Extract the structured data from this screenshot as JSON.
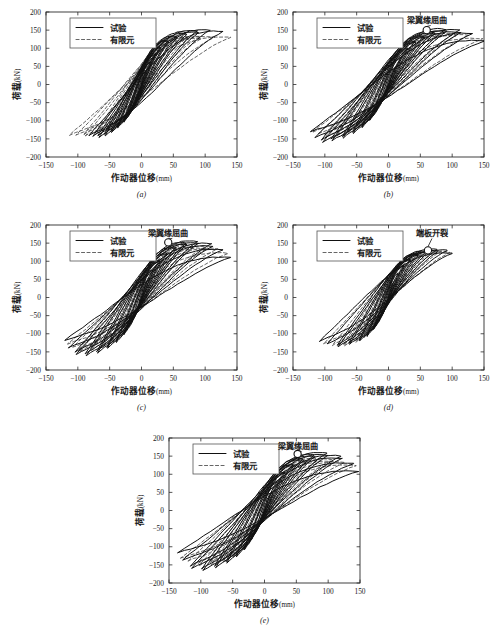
{
  "figure": {
    "panel_count": 5,
    "subcaptions": [
      "(a)",
      "(b)",
      "(c)",
      "(d)",
      "(e)"
    ]
  },
  "axes": {
    "xlabel_main": "作动器位移",
    "xlabel_unit": "(mm)",
    "ylabel_main": "荷载",
    "ylabel_unit": "(kN)",
    "xticks": [
      "-150",
      "-100",
      "-50",
      "0",
      "50",
      "100",
      "150"
    ],
    "yticks": [
      "200",
      "150",
      "100",
      "50",
      "0",
      "-50",
      "-100",
      "-150",
      "-200"
    ],
    "xlim": [
      -150,
      150
    ],
    "ylim": [
      -200,
      200
    ]
  },
  "legend": {
    "test_label": "试验",
    "fem_label": "有限元"
  },
  "annotations": {
    "flange_buckling": "梁翼缘屈曲",
    "endplate_cracking": "端板开裂"
  },
  "colors": {
    "test_line": "#111111",
    "fem_line": "#4a4a4a",
    "frame": "#2a2a2a",
    "background": "#ffffff"
  },
  "chart_data": {
    "type": "line",
    "title": "",
    "xlabel": "作动器位移(mm)",
    "ylabel": "荷载(kN)",
    "xlim": [
      -150,
      150
    ],
    "ylim": [
      -200,
      200
    ],
    "xticks": [
      -150,
      -100,
      -50,
      0,
      50,
      100,
      150
    ],
    "yticks": [
      -200,
      -150,
      -100,
      -50,
      0,
      50,
      100,
      150,
      200
    ],
    "grid": false,
    "legend_position": "upper-left",
    "series_names": [
      "试验",
      "有限元"
    ],
    "panels": [
      {
        "id": "a",
        "subcaption": "(a)",
        "annotation": null,
        "annotation_point": null,
        "test": {
          "peak_pos_load": 150,
          "peak_neg_load": -142,
          "max_disp": 128,
          "min_disp": -82,
          "cycle_amplitudes": [
            8,
            14,
            22,
            30,
            42,
            55,
            70,
            88,
            108,
            128
          ],
          "cycle_peak_loads": [
            40,
            62,
            85,
            103,
            120,
            133,
            143,
            148,
            150,
            146
          ],
          "cycle_neg_loads": [
            -38,
            -60,
            -82,
            -100,
            -116,
            -128,
            -136,
            -140,
            -142,
            -140
          ],
          "neg_disp_limits": [
            -8,
            -14,
            -22,
            -28,
            -38,
            -48,
            -58,
            -68,
            -76,
            -82
          ]
        },
        "fem": {
          "peak_pos_load": 131,
          "peak_neg_load": -140,
          "max_disp": 140,
          "min_disp": -113,
          "cycle_amplitudes": [
            10,
            18,
            28,
            40,
            55,
            72,
            92,
            115,
            140
          ],
          "cycle_peak_loads": [
            45,
            72,
            95,
            112,
            124,
            130,
            132,
            131,
            130
          ],
          "cycle_neg_loads": [
            -44,
            -70,
            -93,
            -110,
            -124,
            -132,
            -137,
            -140,
            -140
          ],
          "neg_disp_limits": [
            -10,
            -18,
            -28,
            -40,
            -55,
            -72,
            -90,
            -103,
            -113
          ]
        }
      },
      {
        "id": "b",
        "subcaption": "(b)",
        "annotation": "梁翼缘屈曲",
        "annotation_point": {
          "x": 60,
          "y": 150
        },
        "test": {
          "peak_pos_load": 152,
          "peak_neg_load": -152,
          "max_disp": 150,
          "min_disp": -122,
          "cycle_amplitudes": [
            12,
            20,
            30,
            42,
            56,
            72,
            90,
            112,
            132,
            150
          ],
          "cycle_peak_loads": [
            48,
            75,
            100,
            118,
            133,
            145,
            152,
            150,
            140,
            120
          ],
          "cycle_neg_loads": [
            -46,
            -72,
            -96,
            -115,
            -130,
            -142,
            -150,
            -152,
            -145,
            -130
          ],
          "neg_disp_limits": [
            -12,
            -20,
            -30,
            -42,
            -56,
            -72,
            -90,
            -105,
            -115,
            -122
          ]
        },
        "fem": {
          "peak_pos_load": 140,
          "peak_neg_load": -138,
          "max_disp": 148,
          "min_disp": -118,
          "cycle_amplitudes": [
            12,
            22,
            34,
            48,
            64,
            82,
            104,
            126,
            148
          ],
          "cycle_peak_loads": [
            50,
            78,
            102,
            120,
            132,
            139,
            140,
            136,
            126
          ],
          "cycle_neg_loads": [
            -48,
            -74,
            -98,
            -116,
            -128,
            -135,
            -138,
            -136,
            -130
          ],
          "neg_disp_limits": [
            -12,
            -22,
            -34,
            -48,
            -64,
            -82,
            -100,
            -110,
            -118
          ]
        }
      },
      {
        "id": "c",
        "subcaption": "(c)",
        "annotation": "梁翼缘屈曲",
        "annotation_point": {
          "x": 42,
          "y": 152
        },
        "test": {
          "peak_pos_load": 155,
          "peak_neg_load": -155,
          "max_disp": 140,
          "min_disp": -120,
          "cycle_amplitudes": [
            10,
            18,
            28,
            40,
            54,
            70,
            88,
            110,
            128,
            140
          ],
          "cycle_peak_loads": [
            48,
            76,
            102,
            122,
            138,
            150,
            155,
            148,
            132,
            110
          ],
          "cycle_neg_loads": [
            -46,
            -74,
            -100,
            -120,
            -136,
            -148,
            -155,
            -150,
            -138,
            -118
          ],
          "neg_disp_limits": [
            -10,
            -18,
            -28,
            -40,
            -54,
            -70,
            -88,
            -104,
            -114,
            -120
          ]
        },
        "fem": {
          "peak_pos_load": 140,
          "peak_neg_load": -142,
          "max_disp": 136,
          "min_disp": -116,
          "cycle_amplitudes": [
            10,
            20,
            32,
            46,
            62,
            80,
            100,
            120,
            136
          ],
          "cycle_peak_loads": [
            50,
            80,
            106,
            124,
            136,
            141,
            140,
            134,
            122
          ],
          "cycle_neg_loads": [
            -48,
            -78,
            -104,
            -122,
            -134,
            -140,
            -142,
            -138,
            -128
          ],
          "neg_disp_limits": [
            -10,
            -20,
            -32,
            -46,
            -62,
            -80,
            -98,
            -108,
            -116
          ]
        }
      },
      {
        "id": "d",
        "subcaption": "(d)",
        "annotation": "端板开裂",
        "annotation_point": {
          "x": 62,
          "y": 130
        },
        "test": {
          "peak_pos_load": 132,
          "peak_neg_load": -130,
          "max_disp": 100,
          "min_disp": -108,
          "cycle_amplitudes": [
            8,
            15,
            24,
            34,
            46,
            60,
            76,
            92,
            100
          ],
          "cycle_peak_loads": [
            42,
            66,
            88,
            105,
            118,
            127,
            132,
            130,
            122
          ],
          "cycle_neg_loads": [
            -40,
            -64,
            -86,
            -103,
            -116,
            -125,
            -130,
            -128,
            -120
          ],
          "neg_disp_limits": [
            -8,
            -15,
            -24,
            -34,
            -46,
            -62,
            -80,
            -96,
            -108
          ]
        },
        "fem": {
          "peak_pos_load": 128,
          "peak_neg_load": -132,
          "max_disp": 96,
          "min_disp": -102,
          "cycle_amplitudes": [
            9,
            17,
            27,
            39,
            52,
            67,
            83,
            96
          ],
          "cycle_peak_loads": [
            45,
            70,
            92,
            108,
            119,
            126,
            128,
            124
          ],
          "cycle_neg_loads": [
            -43,
            -68,
            -90,
            -107,
            -120,
            -128,
            -132,
            -128
          ],
          "neg_disp_limits": [
            -9,
            -17,
            -27,
            -39,
            -52,
            -70,
            -88,
            -102
          ]
        }
      },
      {
        "id": "e",
        "subcaption": "(e)",
        "annotation": "梁翼缘屈曲",
        "annotation_point": {
          "x": 52,
          "y": 156
        },
        "test": {
          "peak_pos_load": 158,
          "peak_neg_load": -160,
          "max_disp": 148,
          "min_disp": -136,
          "cycle_amplitudes": [
            12,
            20,
            32,
            45,
            60,
            78,
            98,
            120,
            140,
            148
          ],
          "cycle_peak_loads": [
            50,
            80,
            106,
            126,
            142,
            153,
            158,
            150,
            130,
            108
          ],
          "cycle_neg_loads": [
            -48,
            -78,
            -104,
            -124,
            -140,
            -152,
            -160,
            -152,
            -136,
            -116
          ],
          "neg_disp_limits": [
            -12,
            -20,
            -32,
            -45,
            -60,
            -78,
            -98,
            -116,
            -128,
            -136
          ]
        },
        "fem": {
          "peak_pos_load": 140,
          "peak_neg_load": -145,
          "max_disp": 144,
          "min_disp": -132,
          "cycle_amplitudes": [
            12,
            22,
            35,
            50,
            66,
            85,
            106,
            126,
            144
          ],
          "cycle_peak_loads": [
            52,
            82,
            108,
            128,
            138,
            142,
            140,
            133,
            124
          ],
          "cycle_neg_loads": [
            -50,
            -80,
            -106,
            -126,
            -138,
            -144,
            -145,
            -140,
            -132
          ],
          "neg_disp_limits": [
            -12,
            -22,
            -35,
            -50,
            -66,
            -85,
            -104,
            -120,
            -132
          ]
        }
      }
    ]
  }
}
